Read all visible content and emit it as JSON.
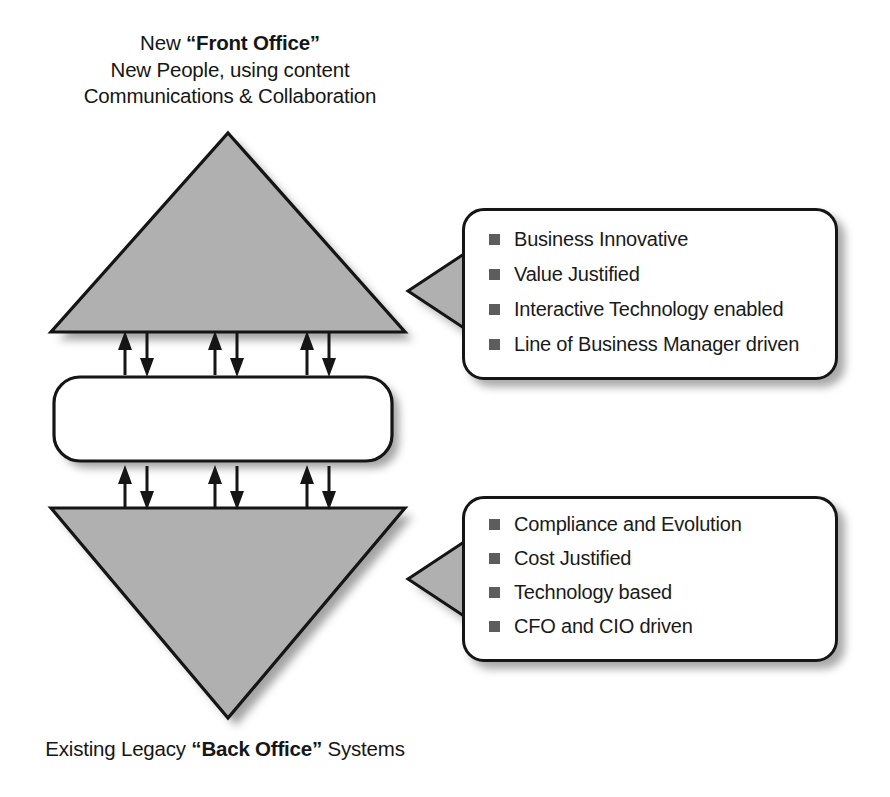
{
  "header": {
    "line1_prefix": "New ",
    "line1_strong": "“Front Office”",
    "line2": "New People, using content",
    "line3": "Communications & Collaboration"
  },
  "footer": {
    "prefix": "Existing Legacy ",
    "strong": "“Back Office”",
    "suffix": " Systems"
  },
  "top_triangle": {
    "line1": "Web 2.0 & SOA",
    "line2": "supporting the",
    "line3": "ability to interact"
  },
  "middle_box": {
    "line1": "Open Standards connecting",
    "line2": "organizations together"
  },
  "bottom_triangle": {
    "line1": "Applications as",
    "line2": "the procedures",
    "line3": "for transactions"
  },
  "callout_top": {
    "bullets": [
      "Business Innovative",
      "Value Justified",
      "Interactive Technology enabled",
      "Line of Business Manager driven"
    ]
  },
  "callout_bottom": {
    "bullets": [
      "Compliance and Evolution",
      "Cost Justified",
      "Technology based",
      "CFO and CIO driven"
    ]
  },
  "connectors": {
    "upper_group_label": "bidirectional-arrows-top",
    "lower_group_label": "bidirectional-arrows-bottom",
    "pair_count": 3
  },
  "colors": {
    "shape_fill_gray": "#b0b0b0",
    "stroke_black": "#151515",
    "bullet_gray": "#5d5d5d",
    "page_background": "#ffffff",
    "box_fill_white": "#ffffff"
  }
}
